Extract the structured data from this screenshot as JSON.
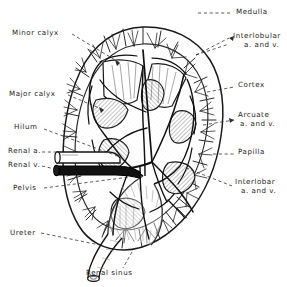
{
  "figure": {
    "style": "black-and-white line drawing",
    "canvas": {
      "width": 287,
      "height": 287,
      "background": "#ffffff"
    },
    "ink_color": "#1a1a1a",
    "shading_color": "#9a9a9a"
  },
  "labels": {
    "minor_calyx": {
      "text": "Minor calyx",
      "x": 12,
      "y": 33,
      "align": "left"
    },
    "major_calyx": {
      "text": "Major calyx",
      "x": 9,
      "y": 94,
      "align": "left"
    },
    "hilum": {
      "text": "Hilum",
      "x": 14,
      "y": 127,
      "align": "left"
    },
    "renal_a": {
      "text": "Renal a.",
      "x": 8,
      "y": 150,
      "align": "left"
    },
    "renal_v": {
      "text": "Renal v.",
      "x": 8,
      "y": 163,
      "align": "left"
    },
    "pelvis": {
      "text": "Pelvis",
      "x": 13,
      "y": 188,
      "align": "left"
    },
    "ureter": {
      "text": "Ureter",
      "x": 10,
      "y": 233,
      "align": "left"
    },
    "renal_sinus": {
      "text": "Renal sinus",
      "x": 86,
      "y": 273,
      "align": "left"
    },
    "medulla": {
      "text": "Medulla",
      "x": 235,
      "y": 12,
      "align": "left"
    },
    "interlobular": {
      "text": "Interlobular",
      "x": 233,
      "y": 36,
      "align": "left"
    },
    "interlobular_2": {
      "text": "a. and v.",
      "x": 244,
      "y": 45,
      "align": "left"
    },
    "cortex": {
      "text": "Cortex",
      "x": 238,
      "y": 85,
      "align": "left"
    },
    "arcuate": {
      "text": "Arcuate",
      "x": 238,
      "y": 115,
      "align": "left"
    },
    "arcuate_2": {
      "text": "a. and v.",
      "x": 238,
      "y": 124,
      "align": "left"
    },
    "papilla": {
      "text": "Papilla",
      "x": 238,
      "y": 152,
      "align": "left"
    },
    "interlobar": {
      "text": "Interlobar",
      "x": 235,
      "y": 182,
      "align": "left"
    },
    "interlobar_2": {
      "text": "a. and v.",
      "x": 240,
      "y": 191,
      "align": "left"
    }
  },
  "structures": [
    {
      "name": "renal-capsule-outline",
      "description": "bean-shaped outer border of the kidney"
    },
    {
      "name": "cortex-band",
      "description": "outer segmented band of cortical tissue"
    },
    {
      "name": "medullary-pyramid",
      "description": "shaded triangular pyramid of the medulla",
      "count": 7
    },
    {
      "name": "renal-papilla",
      "description": "apex of a medullary pyramid projecting into a calyx"
    },
    {
      "name": "minor-calyx",
      "description": "cup receiving a single papilla"
    },
    {
      "name": "major-calyx",
      "description": "channel formed by union of minor calyces"
    },
    {
      "name": "renal-pelvis",
      "description": "funnel-shaped expansion draining into the ureter"
    },
    {
      "name": "ureter",
      "description": "tube descending from the renal pelvis, cut end at bottom"
    },
    {
      "name": "renal-artery",
      "description": "open outline vessel entering the hilum"
    },
    {
      "name": "renal-vein",
      "description": "solid dark vessel leaving the hilum"
    },
    {
      "name": "interlobar-vessels",
      "description": "vessels running between pyramids"
    },
    {
      "name": "arcuate-vessels",
      "description": "vessels arching over pyramid bases"
    },
    {
      "name": "interlobular-vessels",
      "description": "fine vessels radiating into the cortex"
    },
    {
      "name": "renal-sinus",
      "description": "fat-filled cavity containing pelvis and vessels"
    }
  ]
}
